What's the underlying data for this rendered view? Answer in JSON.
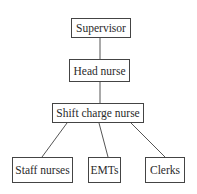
{
  "diagram": {
    "type": "org-chart",
    "nodes": [
      {
        "id": "supervisor",
        "label": "Supervisor"
      },
      {
        "id": "head_nurse",
        "label": "Head nurse"
      },
      {
        "id": "shift_charge_nurse",
        "label": "Shift charge nurse"
      },
      {
        "id": "staff_nurses",
        "label": "Staff nurses"
      },
      {
        "id": "emts",
        "label": "EMTs"
      },
      {
        "id": "clerks",
        "label": "Clerks"
      }
    ],
    "edges": [
      [
        "supervisor",
        "head_nurse"
      ],
      [
        "head_nurse",
        "shift_charge_nurse"
      ],
      [
        "shift_charge_nurse",
        "staff_nurses"
      ],
      [
        "shift_charge_nurse",
        "emts"
      ],
      [
        "shift_charge_nurse",
        "clerks"
      ]
    ]
  }
}
